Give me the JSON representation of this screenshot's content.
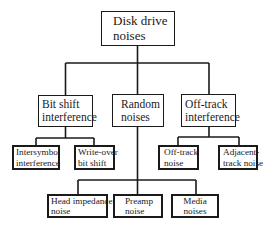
{
  "diagram": {
    "type": "tree",
    "title": "Disk drive noises",
    "line_color": "#1a1a1a",
    "root": {
      "id": "disk-drive-noises",
      "lines": [
        "Disk drive",
        "noises"
      ]
    },
    "level1": [
      {
        "id": "bit-shift-interference",
        "lines": [
          "Bit shift",
          "interference"
        ],
        "children": [
          {
            "id": "intersymbol-interference",
            "lines": [
              "Intersymbol",
              "interference"
            ]
          },
          {
            "id": "write-over-bit-shift",
            "lines": [
              "Write-over",
              "bit shift"
            ]
          }
        ]
      },
      {
        "id": "random-noises",
        "lines": [
          "Random",
          "noises"
        ],
        "children": [
          {
            "id": "head-impedance-noise",
            "lines": [
              "Head impedance",
              "noise"
            ]
          },
          {
            "id": "preamp-noise",
            "lines": [
              "Preamp",
              "noise"
            ]
          },
          {
            "id": "media-noises",
            "lines": [
              "Media",
              "noises"
            ]
          }
        ]
      },
      {
        "id": "off-track-interference",
        "lines": [
          "Off-track",
          "interference"
        ],
        "children": [
          {
            "id": "off-track-noise",
            "lines": [
              "Off-track",
              "noise"
            ]
          },
          {
            "id": "adjacent-track-noise",
            "lines": [
              "Adjacent-",
              "track noise"
            ]
          }
        ]
      }
    ]
  }
}
